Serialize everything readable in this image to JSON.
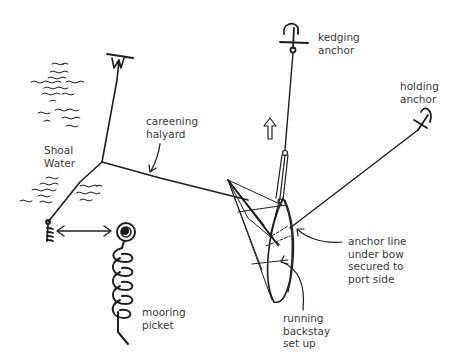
{
  "labels": {
    "kedging_anchor": "kedging\nanchor",
    "holding_anchor": "holding\nanchor",
    "careening_halyard": "careening\nhalyard",
    "shoal_water": "Shoal\nWater",
    "mooring_picket": "mooring\npicket",
    "anchor_line": "anchor line\nunder bow\nsecured to\nport side",
    "running_backstay": "running\nbackstay\nset up"
  },
  "colors": {
    "ink": "#1e1e1e",
    "text": "#3a3a3a",
    "background": "#ffffff"
  }
}
